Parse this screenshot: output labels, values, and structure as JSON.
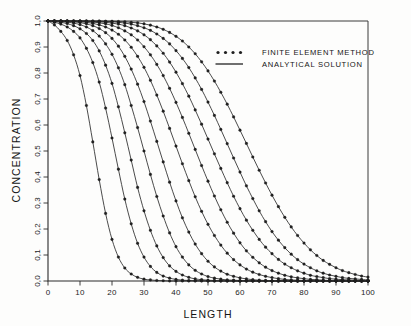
{
  "figure": {
    "background_color": "#fdfdfc",
    "ink_color": "#2a2a2a"
  },
  "legend": {
    "position": "top-right-inside",
    "entries": [
      {
        "label": "FINITE ELEMENT METHOD",
        "style": "dots",
        "marker": "circle-dot"
      },
      {
        "label": "ANALYTICAL SOLUTION",
        "style": "line",
        "marker": "solid-line"
      }
    ]
  },
  "axes": {
    "x": {
      "title": "LENGTH",
      "min": 0,
      "max": 100,
      "ticks": [
        0,
        10,
        20,
        30,
        40,
        50,
        60,
        70,
        80,
        90,
        100
      ],
      "tick_labels": [
        "0",
        "10",
        "20",
        "30",
        "40",
        "50",
        "60",
        "70",
        "80",
        "90",
        "100"
      ]
    },
    "y": {
      "title": "CONCENTRATION",
      "min": 0.0,
      "max": 1.0,
      "ticks": [
        0.0,
        0.1,
        0.2,
        0.3,
        0.4,
        0.5,
        0.6,
        0.7,
        0.8,
        0.9,
        1.0
      ],
      "tick_labels": [
        "0,0",
        "0,1",
        "0,2",
        "0,3",
        "0,4",
        "0,5",
        "0,6",
        "0,7",
        "0,8",
        "0,9",
        "1,0"
      ]
    }
  },
  "chart_data": {
    "type": "line",
    "title": "",
    "xlabel": "LENGTH",
    "ylabel": "CONCENTRATION",
    "xlim": [
      0,
      100
    ],
    "ylim": [
      0.0,
      1.0
    ],
    "grid": false,
    "legend_position": "upper right",
    "x": [
      0,
      2,
      4,
      6,
      8,
      10,
      12,
      14,
      16,
      18,
      20,
      22,
      24,
      26,
      28,
      30,
      32,
      34,
      36,
      38,
      40,
      42,
      44,
      46,
      48,
      50,
      52,
      54,
      56,
      58,
      60,
      62,
      64,
      66,
      68,
      70,
      72,
      74,
      76,
      78,
      80,
      82,
      84,
      86,
      88,
      90,
      92,
      94,
      96,
      98,
      100
    ],
    "series": [
      {
        "name": "curve-1",
        "half_point": 11,
        "steepness": 4.4,
        "values": [
          1.0,
          0.985,
          0.96,
          0.925,
          0.87,
          0.79,
          0.675,
          0.535,
          0.39,
          0.26,
          0.16,
          0.092,
          0.05,
          0.027,
          0.014,
          0.007,
          0.004,
          0.002,
          0.001,
          0.0,
          0.0,
          0.0,
          0.0,
          0.0,
          0.0,
          0.0,
          0.0,
          0.0,
          0.0,
          0.0,
          0.0,
          0.0,
          0.0,
          0.0,
          0.0,
          0.0,
          0.0,
          0.0,
          0.0,
          0.0,
          0.0,
          0.0,
          0.0,
          0.0,
          0.0,
          0.0,
          0.0,
          0.0,
          0.0,
          0.0,
          0.0
        ]
      },
      {
        "name": "curve-2",
        "half_point": 19,
        "steepness": 6.0,
        "values": [
          1.0,
          0.995,
          0.988,
          0.977,
          0.96,
          0.935,
          0.895,
          0.84,
          0.765,
          0.665,
          0.55,
          0.43,
          0.315,
          0.22,
          0.145,
          0.092,
          0.056,
          0.033,
          0.019,
          0.011,
          0.006,
          0.003,
          0.002,
          0.001,
          0.001,
          0.0,
          0.0,
          0.0,
          0.0,
          0.0,
          0.0,
          0.0,
          0.0,
          0.0,
          0.0,
          0.0,
          0.0,
          0.0,
          0.0,
          0.0,
          0.0,
          0.0,
          0.0,
          0.0,
          0.0,
          0.0,
          0.0,
          0.0,
          0.0,
          0.0,
          0.0
        ]
      },
      {
        "name": "curve-3",
        "half_point": 25,
        "steepness": 7.2,
        "values": [
          1.0,
          0.998,
          0.995,
          0.99,
          0.982,
          0.97,
          0.952,
          0.925,
          0.885,
          0.83,
          0.76,
          0.67,
          0.57,
          0.465,
          0.36,
          0.27,
          0.195,
          0.135,
          0.09,
          0.058,
          0.037,
          0.023,
          0.014,
          0.008,
          0.005,
          0.003,
          0.002,
          0.001,
          0.001,
          0.0,
          0.0,
          0.0,
          0.0,
          0.0,
          0.0,
          0.0,
          0.0,
          0.0,
          0.0,
          0.0,
          0.0,
          0.0,
          0.0,
          0.0,
          0.0,
          0.0,
          0.0,
          0.0,
          0.0,
          0.0,
          0.0
        ]
      },
      {
        "name": "curve-4",
        "half_point": 31,
        "steepness": 8.4,
        "values": [
          1.0,
          0.999,
          0.998,
          0.996,
          0.992,
          0.986,
          0.977,
          0.963,
          0.942,
          0.912,
          0.872,
          0.82,
          0.755,
          0.675,
          0.59,
          0.5,
          0.41,
          0.325,
          0.25,
          0.185,
          0.132,
          0.092,
          0.062,
          0.041,
          0.027,
          0.017,
          0.011,
          0.007,
          0.004,
          0.003,
          0.002,
          0.001,
          0.001,
          0.0,
          0.0,
          0.0,
          0.0,
          0.0,
          0.0,
          0.0,
          0.0,
          0.0,
          0.0,
          0.0,
          0.0,
          0.0,
          0.0,
          0.0,
          0.0,
          0.0,
          0.0
        ]
      },
      {
        "name": "curve-5",
        "half_point": 37,
        "steepness": 9.6,
        "values": [
          1.0,
          1.0,
          0.999,
          0.998,
          0.997,
          0.994,
          0.989,
          0.982,
          0.971,
          0.955,
          0.933,
          0.903,
          0.864,
          0.815,
          0.757,
          0.69,
          0.615,
          0.537,
          0.458,
          0.38,
          0.308,
          0.243,
          0.188,
          0.142,
          0.105,
          0.076,
          0.054,
          0.038,
          0.026,
          0.018,
          0.012,
          0.008,
          0.005,
          0.003,
          0.002,
          0.001,
          0.001,
          0.001,
          0.0,
          0.0,
          0.0,
          0.0,
          0.0,
          0.0,
          0.0,
          0.0,
          0.0,
          0.0,
          0.0,
          0.0,
          0.0
        ]
      },
      {
        "name": "curve-6",
        "half_point": 43,
        "steepness": 10.8,
        "values": [
          1.0,
          1.0,
          1.0,
          0.999,
          0.998,
          0.997,
          0.995,
          0.991,
          0.985,
          0.977,
          0.965,
          0.949,
          0.927,
          0.899,
          0.864,
          0.822,
          0.772,
          0.715,
          0.653,
          0.587,
          0.519,
          0.451,
          0.386,
          0.324,
          0.268,
          0.218,
          0.175,
          0.138,
          0.107,
          0.082,
          0.062,
          0.046,
          0.034,
          0.025,
          0.018,
          0.013,
          0.009,
          0.006,
          0.004,
          0.003,
          0.002,
          0.002,
          0.001,
          0.001,
          0.001,
          0.0,
          0.0,
          0.0,
          0.0,
          0.0,
          0.0
        ]
      },
      {
        "name": "curve-7",
        "half_point": 49,
        "steepness": 12.0,
        "values": [
          1.0,
          1.0,
          1.0,
          1.0,
          0.999,
          0.999,
          0.998,
          0.996,
          0.993,
          0.989,
          0.983,
          0.974,
          0.962,
          0.947,
          0.927,
          0.901,
          0.87,
          0.833,
          0.79,
          0.741,
          0.687,
          0.629,
          0.568,
          0.506,
          0.444,
          0.384,
          0.327,
          0.274,
          0.226,
          0.184,
          0.147,
          0.116,
          0.091,
          0.07,
          0.053,
          0.04,
          0.03,
          0.022,
          0.016,
          0.012,
          0.009,
          0.006,
          0.005,
          0.003,
          0.002,
          0.002,
          0.001,
          0.001,
          0.001,
          0.0,
          0.0
        ]
      },
      {
        "name": "curve-8",
        "half_point": 55,
        "steepness": 13.0,
        "values": [
          1.0,
          1.0,
          1.0,
          1.0,
          1.0,
          1.0,
          0.999,
          0.998,
          0.997,
          0.995,
          0.992,
          0.988,
          0.982,
          0.973,
          0.962,
          0.947,
          0.928,
          0.904,
          0.876,
          0.842,
          0.803,
          0.759,
          0.711,
          0.658,
          0.603,
          0.546,
          0.489,
          0.433,
          0.378,
          0.326,
          0.278,
          0.234,
          0.195,
          0.16,
          0.13,
          0.105,
          0.083,
          0.065,
          0.051,
          0.039,
          0.03,
          0.022,
          0.017,
          0.013,
          0.009,
          0.007,
          0.005,
          0.004,
          0.003,
          0.002,
          0.002
        ]
      },
      {
        "name": "curve-9",
        "half_point": 61,
        "steepness": 14.0,
        "values": [
          1.0,
          1.0,
          1.0,
          1.0,
          1.0,
          1.0,
          1.0,
          0.999,
          0.999,
          0.998,
          0.997,
          0.995,
          0.992,
          0.988,
          0.982,
          0.974,
          0.964,
          0.95,
          0.933,
          0.912,
          0.886,
          0.856,
          0.821,
          0.781,
          0.737,
          0.688,
          0.637,
          0.583,
          0.528,
          0.473,
          0.419,
          0.366,
          0.317,
          0.27,
          0.228,
          0.19,
          0.157,
          0.128,
          0.103,
          0.082,
          0.065,
          0.051,
          0.039,
          0.03,
          0.023,
          0.018,
          0.013,
          0.01,
          0.008,
          0.006,
          0.004
        ]
      },
      {
        "name": "curve-10",
        "half_point": 68,
        "steepness": 15.0,
        "values": [
          1.0,
          1.0,
          1.0,
          1.0,
          1.0,
          1.0,
          1.0,
          1.0,
          1.0,
          0.999,
          0.999,
          0.998,
          0.997,
          0.995,
          0.993,
          0.989,
          0.984,
          0.977,
          0.968,
          0.956,
          0.941,
          0.923,
          0.9,
          0.874,
          0.843,
          0.808,
          0.769,
          0.726,
          0.68,
          0.631,
          0.58,
          0.529,
          0.477,
          0.426,
          0.377,
          0.33,
          0.286,
          0.245,
          0.208,
          0.175,
          0.146,
          0.12,
          0.098,
          0.079,
          0.064,
          0.051,
          0.04,
          0.032,
          0.025,
          0.019,
          0.015
        ]
      }
    ]
  }
}
